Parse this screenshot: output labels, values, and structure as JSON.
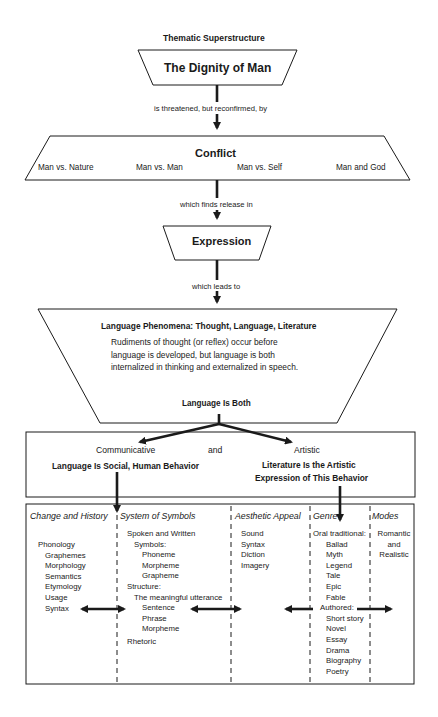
{
  "title": "Thematic Superstructure",
  "dignity": {
    "label": "The Dignity of Man"
  },
  "connector1": "is threatened, but reconfirmed, by",
  "conflict": {
    "label": "Conflict",
    "types": [
      "Man vs. Nature",
      "Man vs. Man",
      "Man vs. Self",
      "Man and God"
    ]
  },
  "connector2": "which finds release in",
  "expression": {
    "label": "Expression"
  },
  "connector3": "which leads to",
  "phenomena": {
    "heading": "Language Phenomena:  Thought, Language, Literature",
    "body": "Rudiments of thought (or reflex) occur before language is developed, but language is both internalized in thinking and externalized in speech.",
    "footer": "Language Is Both"
  },
  "both": {
    "communicative": "Communicative",
    "and": "and",
    "artistic": "Artistic",
    "social": "Language Is Social, Human Behavior",
    "literature_line1": "Literature Is the Artistic",
    "literature_line2": "Expression of This Behavior"
  },
  "columns": [
    {
      "heading": "Change and History",
      "items": [
        "Phonology",
        "Graphemes",
        "Morphology",
        "Semantics",
        "Etymology",
        "Usage",
        "Syntax"
      ]
    },
    {
      "heading": "System of Symbols",
      "items": [
        "Spoken and Written",
        "Symbols:",
        "Phoneme",
        "Morpheme",
        "Grapheme",
        "Structure:",
        "The meaningful utterance",
        "Sentence",
        "Phrase",
        "Morpheme",
        "Rhetoric"
      ]
    },
    {
      "heading": "Aesthetic Appeal",
      "items": [
        "Sound",
        "Syntax",
        "Diction",
        "Imagery"
      ]
    },
    {
      "heading": "Genre",
      "items": [
        "Oral traditional:",
        "Ballad",
        "Myth",
        "Legend",
        "Tale",
        "Epic",
        "Fable",
        "Authored:",
        "Short story",
        "Novel",
        "Essay",
        "Drama",
        "Biography",
        "Poetry"
      ]
    },
    {
      "heading": "Modes",
      "items": [
        "Romantic",
        "and",
        "Realistic"
      ]
    }
  ],
  "colors": {
    "ink": "#1a1a1a",
    "background": "#ffffff"
  }
}
